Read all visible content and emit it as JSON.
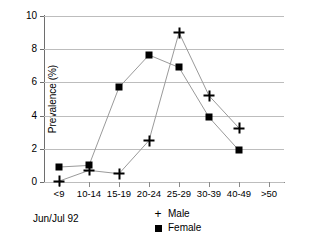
{
  "chart_data": {
    "type": "line",
    "title": "",
    "xlabel": "",
    "ylabel": "Prevalence (%)",
    "categories": [
      "<9",
      "10-14",
      "15-19",
      "20-24",
      "25-29",
      "30-39",
      "40-49",
      ">50"
    ],
    "ylim": [
      0,
      10
    ],
    "yticks": [
      0,
      2,
      4,
      6,
      8,
      10
    ],
    "grid": true,
    "legend_position": "bottom-center",
    "annotation": "Jun/Jul 92",
    "series": [
      {
        "name": "Male",
        "marker": "plus",
        "values": [
          0.05,
          0.7,
          0.5,
          2.5,
          9.0,
          5.2,
          3.25,
          null
        ]
      },
      {
        "name": "Female",
        "marker": "square",
        "values": [
          0.9,
          1.0,
          5.7,
          7.65,
          6.9,
          3.9,
          1.9,
          null
        ]
      }
    ]
  },
  "legend": {
    "items": [
      {
        "label": "Male",
        "key": "plus-marker"
      },
      {
        "label": "Female",
        "key": "square-marker"
      }
    ]
  },
  "caption": {
    "text": "Jun/Jul 92"
  },
  "colors": {
    "series_line": "#9a9a9a",
    "marker": "#000000",
    "gridline": "#bdbdbd",
    "axis": "#6e6e6e"
  }
}
